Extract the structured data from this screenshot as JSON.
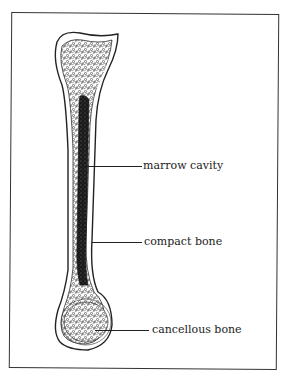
{
  "diagram": {
    "labels": [
      {
        "id": "marrow-cavity",
        "text": "marrow cavity"
      },
      {
        "id": "compact-bone",
        "text": "compact bone"
      },
      {
        "id": "cancellous-bone",
        "text": "cancellous bone"
      }
    ]
  },
  "colors": {
    "line": "#222222",
    "marrow": "#1a1a1a",
    "background": "#ffffff"
  }
}
